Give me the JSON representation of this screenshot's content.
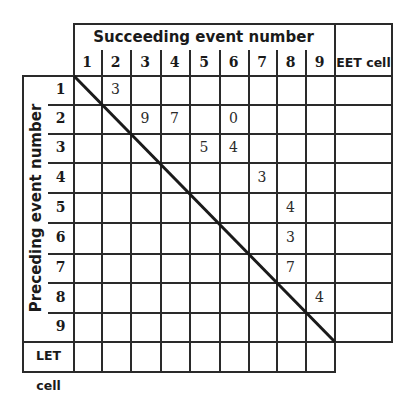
{
  "header": {
    "title": "Succeeding event number",
    "columns": [
      "1",
      "2",
      "3",
      "4",
      "5",
      "6",
      "7",
      "8",
      "9"
    ],
    "extra_column": "EET cell"
  },
  "side": {
    "title": "Preceding event number",
    "rows": [
      "1",
      "2",
      "3",
      "4",
      "5",
      "6",
      "7",
      "8",
      "9"
    ],
    "extra_row": "LET cell"
  },
  "cells": [
    {
      "row": 1,
      "col": 2,
      "value": "3"
    },
    {
      "row": 2,
      "col": 3,
      "value": "9"
    },
    {
      "row": 2,
      "col": 4,
      "value": "7"
    },
    {
      "row": 2,
      "col": 6,
      "value": "0"
    },
    {
      "row": 3,
      "col": 5,
      "value": "5"
    },
    {
      "row": 3,
      "col": 6,
      "value": "4"
    },
    {
      "row": 4,
      "col": 7,
      "value": "3"
    },
    {
      "row": 5,
      "col": 8,
      "value": "4"
    },
    {
      "row": 6,
      "col": 8,
      "value": "3"
    },
    {
      "row": 7,
      "col": 8,
      "value": "7"
    },
    {
      "row": 8,
      "col": 9,
      "value": "4"
    }
  ],
  "colors": {
    "line": "#2a2a2a",
    "background": "#ffffff"
  }
}
